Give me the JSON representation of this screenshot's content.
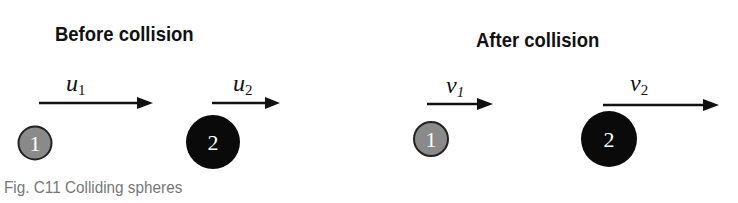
{
  "before": {
    "title": "Before collision",
    "u1": {
      "symbol": "u",
      "sub": "1"
    },
    "u2": {
      "symbol": "u",
      "sub": "2"
    },
    "sphere1": {
      "label": "1",
      "color": "#8a8a8a"
    },
    "sphere2": {
      "label": "2",
      "color": "#0a0a0a"
    }
  },
  "after": {
    "title": "After collision",
    "v1": {
      "symbol": "v",
      "sub": "1"
    },
    "v2": {
      "symbol": "v",
      "sub": "2"
    },
    "sphere1": {
      "label": "1",
      "color": "#8a8a8a"
    },
    "sphere2": {
      "label": "2",
      "color": "#0a0a0a"
    }
  },
  "caption": "Fig. C11 Colliding spheres"
}
